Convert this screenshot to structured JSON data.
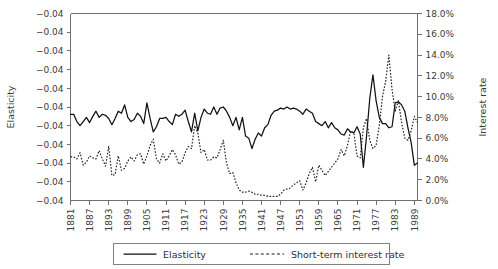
{
  "chart_data": {
    "type": "line",
    "title": "",
    "subtitle": "",
    "xlabel": "",
    "ylabel": "Elasticity",
    "y2label": "Interest rate",
    "grid": false,
    "legend_position": "bottom",
    "x_range": [
      1881,
      1990
    ],
    "x_tick_labels": [
      "1881",
      "1887",
      "1893",
      "1899",
      "1905",
      "1911",
      "1917",
      "1923",
      "1929",
      "1935",
      "1941",
      "1947",
      "1953",
      "1959",
      "1965",
      "1971",
      "1977",
      "1983",
      "1989"
    ],
    "x_tick_values": [
      1881,
      1887,
      1893,
      1899,
      1905,
      1911,
      1917,
      1923,
      1929,
      1935,
      1941,
      1947,
      1953,
      1959,
      1965,
      1971,
      1977,
      1983,
      1989
    ],
    "ylim": [
      -0.04,
      -0.04
    ],
    "y_tick_labels": [
      "-0.04",
      "-0.04",
      "-0.04",
      "-0.04",
      "-0.04",
      "-0.04",
      "-0.04",
      "-0.04",
      "-0.04",
      "-0.04",
      "-0.04"
    ],
    "y2lim": [
      0.0,
      18.0
    ],
    "y2_tick_labels": [
      "18.0%",
      "16.0%",
      "14.0%",
      "12.0%",
      "10.0%",
      "8.0%",
      "6.0%",
      "4.0%",
      "2.0%",
      "0.0%"
    ],
    "y2_tick_values": [
      18.0,
      16.0,
      14.0,
      12.0,
      10.0,
      8.0,
      6.0,
      4.0,
      2.0,
      0.0
    ],
    "series": [
      {
        "name": "Elasticity",
        "style": "solid",
        "axis": "left",
        "x": [
          1881,
          1882,
          1883,
          1884,
          1885,
          1886,
          1887,
          1888,
          1889,
          1890,
          1891,
          1892,
          1893,
          1894,
          1895,
          1896,
          1897,
          1898,
          1899,
          1900,
          1901,
          1902,
          1903,
          1904,
          1905,
          1906,
          1907,
          1908,
          1909,
          1910,
          1911,
          1912,
          1913,
          1914,
          1915,
          1916,
          1917,
          1918,
          1919,
          1920,
          1921,
          1922,
          1923,
          1924,
          1925,
          1926,
          1927,
          1928,
          1929,
          1930,
          1931,
          1932,
          1933,
          1934,
          1935,
          1936,
          1937,
          1938,
          1939,
          1940,
          1941,
          1942,
          1943,
          1944,
          1945,
          1946,
          1947,
          1948,
          1949,
          1950,
          1951,
          1952,
          1953,
          1954,
          1955,
          1956,
          1957,
          1958,
          1959,
          1960,
          1961,
          1962,
          1963,
          1964,
          1965,
          1966,
          1967,
          1968,
          1969,
          1970,
          1971,
          1972,
          1973,
          1974,
          1975,
          1976,
          1977,
          1978,
          1979,
          1980,
          1981,
          1982,
          1983,
          1984,
          1985,
          1986,
          1987,
          1988,
          1989,
          1990
        ],
        "values_pct": [
          8.3,
          8.3,
          7.6,
          7.2,
          7.6,
          8.0,
          7.5,
          8.1,
          8.6,
          8.0,
          8.3,
          8.2,
          7.9,
          7.3,
          7.9,
          8.6,
          8.4,
          9.2,
          8.0,
          7.6,
          7.8,
          8.4,
          8.1,
          7.4,
          9.4,
          7.9,
          6.6,
          7.1,
          7.9,
          7.9,
          8.0,
          7.6,
          7.3,
          8.3,
          8.1,
          8.3,
          8.7,
          7.6,
          6.6,
          8.4,
          6.7,
          8.0,
          8.8,
          8.4,
          8.3,
          9.0,
          8.3,
          8.9,
          9.0,
          8.6,
          8.0,
          7.2,
          8.0,
          6.8,
          8.0,
          6.2,
          6.0,
          5.0,
          5.9,
          6.5,
          6.2,
          7.0,
          7.3,
          8.2,
          8.6,
          8.7,
          8.9,
          8.8,
          9.0,
          8.8,
          8.9,
          8.8,
          8.6,
          8.3,
          8.8,
          8.6,
          8.4,
          7.6,
          7.4,
          7.2,
          7.6,
          7.0,
          7.5,
          7.0,
          6.8,
          6.4,
          6.3,
          6.9,
          6.6,
          6.5,
          7.1,
          6.4,
          3.2,
          6.2,
          9.8,
          12.1,
          9.6,
          8.0,
          7.4,
          7.4,
          7.0,
          7.1,
          9.4,
          9.5,
          9.2,
          8.6,
          7.0,
          5.6,
          3.4,
          3.6
        ]
      },
      {
        "name": "Short-term interest rate",
        "style": "dotted",
        "axis": "right",
        "x": [
          1881,
          1882,
          1883,
          1884,
          1885,
          1886,
          1887,
          1888,
          1889,
          1890,
          1891,
          1892,
          1893,
          1894,
          1895,
          1896,
          1897,
          1898,
          1899,
          1900,
          1901,
          1902,
          1903,
          1904,
          1905,
          1906,
          1907,
          1908,
          1909,
          1910,
          1911,
          1912,
          1913,
          1914,
          1915,
          1916,
          1917,
          1918,
          1919,
          1920,
          1921,
          1922,
          1923,
          1924,
          1925,
          1926,
          1927,
          1928,
          1929,
          1930,
          1931,
          1932,
          1933,
          1934,
          1935,
          1936,
          1937,
          1938,
          1939,
          1940,
          1941,
          1942,
          1943,
          1944,
          1945,
          1946,
          1947,
          1948,
          1949,
          1950,
          1951,
          1952,
          1953,
          1954,
          1955,
          1956,
          1957,
          1958,
          1959,
          1960,
          1961,
          1962,
          1963,
          1964,
          1965,
          1966,
          1967,
          1968,
          1969,
          1970,
          1971,
          1972,
          1973,
          1974,
          1975,
          1976,
          1977,
          1978,
          1979,
          1980,
          1981,
          1982,
          1983,
          1984,
          1985,
          1986,
          1987,
          1988,
          1989,
          1990
        ],
        "values_pct": [
          4.2,
          4.2,
          4.0,
          4.6,
          3.4,
          3.7,
          4.3,
          4.1,
          4.0,
          4.8,
          4.0,
          3.3,
          5.2,
          2.4,
          2.5,
          4.3,
          2.9,
          3.1,
          3.8,
          4.2,
          3.8,
          4.4,
          4.5,
          3.5,
          4.3,
          5.3,
          5.9,
          4.0,
          3.6,
          4.5,
          3.8,
          4.3,
          4.9,
          4.4,
          3.5,
          3.7,
          4.6,
          5.2,
          5.0,
          7.2,
          6.5,
          4.6,
          4.9,
          3.9,
          3.9,
          4.2,
          4.1,
          4.9,
          5.8,
          3.6,
          2.6,
          2.7,
          1.7,
          1.0,
          0.8,
          0.8,
          0.9,
          0.8,
          0.6,
          0.6,
          0.5,
          0.5,
          0.4,
          0.4,
          0.4,
          0.4,
          0.6,
          1.0,
          1.1,
          1.2,
          1.5,
          1.7,
          1.9,
          1.0,
          1.7,
          2.6,
          3.2,
          1.8,
          3.4,
          2.9,
          2.4,
          2.8,
          3.2,
          3.6,
          4.0,
          4.9,
          4.3,
          5.3,
          6.7,
          6.5,
          4.3,
          4.1,
          7.0,
          7.9,
          5.8,
          5.0,
          5.3,
          7.2,
          10.0,
          11.5,
          14.0,
          10.7,
          8.6,
          9.6,
          7.5,
          6.0,
          5.8,
          6.7,
          8.1,
          7.5
        ]
      }
    ]
  },
  "legend": {
    "items": [
      {
        "label": "Elasticity",
        "style": "solid"
      },
      {
        "label": "Short-term interest rate",
        "style": "dotted"
      }
    ]
  }
}
